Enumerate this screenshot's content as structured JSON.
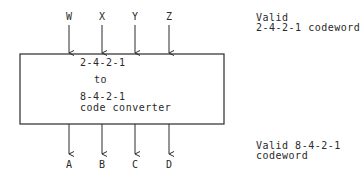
{
  "diagram": {
    "inputs": [
      "W",
      "X",
      "Y",
      "Z"
    ],
    "outputs": [
      "A",
      "B",
      "C",
      "D"
    ],
    "block": {
      "line1": "2-4-2-1",
      "line2": "to",
      "line3": "8-4-2-1",
      "line4": "code converter"
    },
    "input_note": {
      "line1": "Valid",
      "line2": "2-4-2-1 codeword"
    },
    "output_note": {
      "line1": "Valid 8-4-2-1",
      "line2": "codeword"
    }
  }
}
